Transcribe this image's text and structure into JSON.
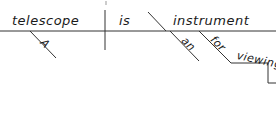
{
  "diagram": {
    "type": "sentence-diagram",
    "sentence": "A telescope is an instrument for viewing",
    "line_color": "#333333",
    "subject": {
      "word": "telescope",
      "modifiers": [
        "A"
      ]
    },
    "verb": {
      "word": "is"
    },
    "complement": {
      "type": "predicate-nominative",
      "word": "instrument",
      "modifiers": [
        "an"
      ],
      "prepositional_phrase": {
        "preposition": "for",
        "object": "viewing"
      }
    }
  }
}
